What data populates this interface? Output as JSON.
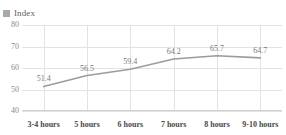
{
  "title_remnant": "",
  "legend": {
    "swatch_color": "#a9a9a9",
    "label": "Index"
  },
  "axes": {
    "y_ticks": [
      "80",
      "70",
      "60",
      "50",
      "40"
    ],
    "x_label": "",
    "y_label": ""
  },
  "chart_data": {
    "type": "line",
    "title": "",
    "subtitle": "",
    "xlabel": "",
    "ylabel": "",
    "categories": [
      "3-4 hours",
      "5 hours",
      "6 hours",
      "7 hours",
      "8 hours",
      "9-10 hours"
    ],
    "values": [
      51.4,
      56.5,
      59.4,
      64.2,
      65.7,
      64.7
    ],
    "data_labels": [
      "51.4",
      "56.5",
      "59.4",
      "64.2",
      "65.7",
      "64.7"
    ],
    "series": [
      {
        "name": "Index",
        "values": [
          51.4,
          56.5,
          59.4,
          64.2,
          65.7,
          64.7
        ],
        "color": "#9c9c9c"
      }
    ],
    "ylim": [
      40,
      80
    ],
    "y_ticks": [
      40,
      50,
      60,
      70,
      80
    ],
    "grid": true,
    "legend_position": "top-left",
    "line_color": "#9c9c9c",
    "grid_color": "#e3e3e3"
  }
}
